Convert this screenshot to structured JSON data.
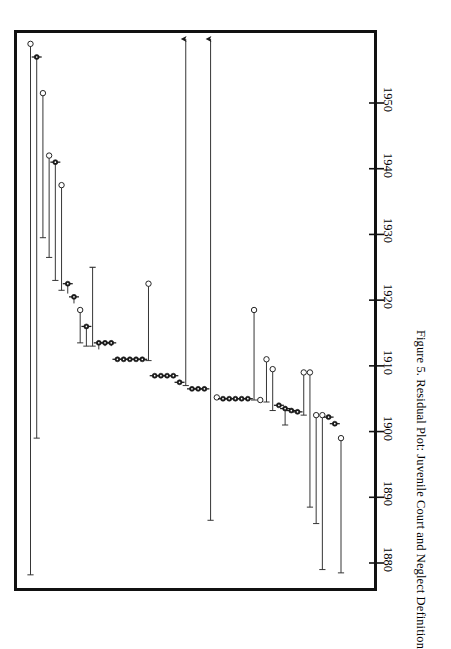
{
  "figure": {
    "caption": "Figure 5.   Residual Plot: Juvenile Court and Neglect Definition",
    "watermark": " "
  },
  "axis": {
    "orientation": "vertical-rotated",
    "tick_labels": [
      "1880",
      "1890",
      "1900",
      "1910",
      "1920",
      "1930",
      "1940",
      "1950"
    ],
    "tick_values": [
      1880,
      1890,
      1900,
      1910,
      1920,
      1930,
      1940,
      1950
    ]
  },
  "colors": {
    "frame": "#111111",
    "line": "#2b2b2b",
    "marker_open": "#ffffff",
    "marker_fill": "#1a1a1a",
    "watermark": "#fbfbfb"
  },
  "chart_data": {
    "type": "scatter",
    "title": "Residual Plot: Juvenile Court and Neglect Definition",
    "subtitle": "",
    "xlabel": "",
    "ylabel": "Year",
    "orientation": "horizontal-bars-rotated",
    "grid": false,
    "legend": null,
    "ylim": [
      1874,
      1961
    ],
    "axis_ticks": [
      1880,
      1890,
      1900,
      1910,
      1920,
      1930,
      1940,
      1950
    ],
    "notes": [
      "Each observation is drawn as a line from its fitted/start year to its observed year.",
      "Open circle marker = observed value; filled circle with whiskers = value with interval.",
      "Two observations run off the top of the plotting region and are shown with arrowheads."
    ],
    "points": [
      {
        "i": 1,
        "year_end": 1959.0,
        "year_start": 1878.2,
        "marker": "open",
        "offscale": false
      },
      {
        "i": 2,
        "year_end": 1957.0,
        "year_start": 1899.0,
        "marker": "filled",
        "offscale": false
      },
      {
        "i": 3,
        "year_end": 1951.5,
        "year_start": 1929.5,
        "marker": "open",
        "offscale": false
      },
      {
        "i": 4,
        "year_end": 1942.0,
        "year_start": 1926.5,
        "marker": "open",
        "offscale": false
      },
      {
        "i": 5,
        "year_end": 1941.0,
        "year_start": 1923.0,
        "marker": "filled",
        "offscale": false
      },
      {
        "i": 6,
        "year_end": 1937.5,
        "year_start": 1921.5,
        "marker": "open",
        "offscale": false
      },
      {
        "i": 7,
        "year_end": 1922.5,
        "year_start": 1921.0,
        "marker": "filled",
        "offscale": false
      },
      {
        "i": 8,
        "year_end": 1920.5,
        "year_start": 1919.5,
        "marker": "filled",
        "offscale": false
      },
      {
        "i": 9,
        "year_end": 1918.5,
        "year_start": 1913.5,
        "marker": "open",
        "offscale": false
      },
      {
        "i": 10,
        "year_end": 1916.0,
        "year_start": 1913.0,
        "marker": "filled",
        "offscale": false
      },
      {
        "i": 11,
        "year_end": 1925.0,
        "year_start": 1913.0,
        "marker": "bar",
        "offscale": false
      },
      {
        "i": 12,
        "year_end": 1913.5,
        "year_start": 1912.5,
        "marker": "filled",
        "offscale": false
      },
      {
        "i": 13,
        "year_end": 1913.5,
        "year_start": 1913.0,
        "marker": "filled",
        "offscale": false
      },
      {
        "i": 14,
        "year_end": 1913.5,
        "year_start": 1913.0,
        "marker": "filled",
        "offscale": false
      },
      {
        "i": 15,
        "year_end": 1911.0,
        "year_start": 1910.8,
        "marker": "filled",
        "offscale": false
      },
      {
        "i": 16,
        "year_end": 1911.0,
        "year_start": 1910.8,
        "marker": "filled",
        "offscale": false
      },
      {
        "i": 17,
        "year_end": 1911.0,
        "year_start": 1910.8,
        "marker": "filled",
        "offscale": false
      },
      {
        "i": 18,
        "year_end": 1911.0,
        "year_start": 1910.8,
        "marker": "filled",
        "offscale": false
      },
      {
        "i": 19,
        "year_end": 1911.0,
        "year_start": 1910.8,
        "marker": "filled",
        "offscale": false
      },
      {
        "i": 20,
        "year_end": 1922.5,
        "year_start": 1910.8,
        "marker": "open",
        "offscale": false
      },
      {
        "i": 21,
        "year_end": 1908.5,
        "year_start": 1908.2,
        "marker": "filled",
        "offscale": false
      },
      {
        "i": 22,
        "year_end": 1908.5,
        "year_start": 1908.2,
        "marker": "filled",
        "offscale": false
      },
      {
        "i": 23,
        "year_end": 1908.5,
        "year_start": 1908.2,
        "marker": "filled",
        "offscale": false
      },
      {
        "i": 24,
        "year_end": 1908.5,
        "year_start": 1908.2,
        "marker": "filled",
        "offscale": false
      },
      {
        "i": 25,
        "year_end": 1907.5,
        "year_start": 1907.2,
        "marker": "filled",
        "offscale": false
      },
      {
        "i": 26,
        "year_end": 1962.0,
        "year_start": 1907.0,
        "marker": "open",
        "offscale": true
      },
      {
        "i": 27,
        "year_end": 1906.5,
        "year_start": 1906.2,
        "marker": "filled",
        "offscale": false
      },
      {
        "i": 28,
        "year_end": 1906.5,
        "year_start": 1906.2,
        "marker": "filled",
        "offscale": false
      },
      {
        "i": 29,
        "year_end": 1906.5,
        "year_start": 1906.2,
        "marker": "filled",
        "offscale": false
      },
      {
        "i": 30,
        "year_end": 1962.0,
        "year_start": 1886.5,
        "marker": "open",
        "offscale": true
      },
      {
        "i": 31,
        "year_end": 1905.2,
        "year_start": 1905.0,
        "marker": "open",
        "offscale": false
      },
      {
        "i": 32,
        "year_end": 1905.0,
        "year_start": 1904.8,
        "marker": "filled",
        "offscale": false
      },
      {
        "i": 33,
        "year_end": 1905.0,
        "year_start": 1904.8,
        "marker": "filled",
        "offscale": false
      },
      {
        "i": 34,
        "year_end": 1905.0,
        "year_start": 1904.8,
        "marker": "filled",
        "offscale": false
      },
      {
        "i": 35,
        "year_end": 1905.0,
        "year_start": 1904.8,
        "marker": "filled",
        "offscale": false
      },
      {
        "i": 36,
        "year_end": 1905.0,
        "year_start": 1904.8,
        "marker": "filled",
        "offscale": false
      },
      {
        "i": 37,
        "year_end": 1918.5,
        "year_start": 1904.8,
        "marker": "open",
        "offscale": false
      },
      {
        "i": 38,
        "year_end": 1904.8,
        "year_start": 1904.5,
        "marker": "open",
        "offscale": false
      },
      {
        "i": 39,
        "year_end": 1911.0,
        "year_start": 1904.5,
        "marker": "open",
        "offscale": false
      },
      {
        "i": 40,
        "year_end": 1909.5,
        "year_start": 1903.2,
        "marker": "open",
        "offscale": false
      },
      {
        "i": 41,
        "year_end": 1904.0,
        "year_start": 1903.8,
        "marker": "filled",
        "offscale": false
      },
      {
        "i": 42,
        "year_end": 1903.5,
        "year_start": 1901.0,
        "marker": "filled",
        "offscale": false
      },
      {
        "i": 43,
        "year_end": 1903.2,
        "year_start": 1903.0,
        "marker": "filled",
        "offscale": false
      },
      {
        "i": 44,
        "year_end": 1903.0,
        "year_start": 1902.8,
        "marker": "filled",
        "offscale": false
      },
      {
        "i": 45,
        "year_end": 1909.0,
        "year_start": 1902.5,
        "marker": "open",
        "offscale": false
      },
      {
        "i": 46,
        "year_end": 1909.0,
        "year_start": 1888.5,
        "marker": "open",
        "offscale": false
      },
      {
        "i": 47,
        "year_end": 1902.5,
        "year_start": 1886.0,
        "marker": "open",
        "offscale": false
      },
      {
        "i": 48,
        "year_end": 1902.5,
        "year_start": 1879.0,
        "marker": "open",
        "offscale": false
      },
      {
        "i": 49,
        "year_end": 1902.2,
        "year_start": 1902.0,
        "marker": "filled",
        "offscale": false
      },
      {
        "i": 50,
        "year_end": 1901.2,
        "year_start": 1901.0,
        "marker": "filled",
        "offscale": false
      },
      {
        "i": 51,
        "year_end": 1899.0,
        "year_start": 1878.5,
        "marker": "open",
        "offscale": false
      }
    ]
  }
}
